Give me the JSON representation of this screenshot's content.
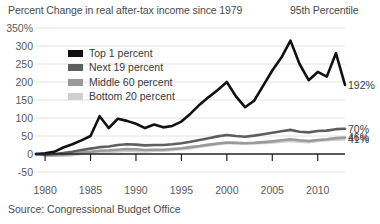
{
  "header": {
    "title": "Percent Change in real after-tax income since 1979",
    "right_note": "95th Percentile"
  },
  "source": "Source: Congressional Budget Office",
  "colors": {
    "top1": "#111111",
    "next19": "#5e5e5e",
    "middle60": "#9a9a9a",
    "bottom20": "#cfcfcf",
    "axis": "#222222",
    "grid": "#e2e2e2",
    "text": "#3a3a3a"
  },
  "legend": {
    "items": [
      {
        "label": "Top 1 percent",
        "color": "#111111"
      },
      {
        "label": "Next 19 percent",
        "color": "#5e5e5e"
      },
      {
        "label": "Middle 60 percent",
        "color": "#9a9a9a"
      },
      {
        "label": "Bottom 20 percent",
        "color": "#cfcfcf"
      }
    ]
  },
  "end_labels": [
    {
      "name": "top1",
      "text": "192%",
      "value": 192
    },
    {
      "name": "next19",
      "text": "70%",
      "value": 70
    },
    {
      "name": "middle60",
      "text": "46%",
      "value": 46
    },
    {
      "name": "bottom20",
      "text": "41%",
      "value": 41
    }
  ],
  "chart_data": {
    "type": "line",
    "title": "Percent Change in real after-tax income since 1979",
    "xlabel": "",
    "ylabel": "",
    "xlim": [
      1979,
      2013
    ],
    "ylim": [
      -50,
      350
    ],
    "ytick_labels": [
      "350%",
      "300",
      "250",
      "200",
      "150",
      "100",
      "50",
      "0",
      "-50"
    ],
    "yticks": [
      350,
      300,
      250,
      200,
      150,
      100,
      50,
      0,
      -50
    ],
    "xticks": [
      1980,
      1985,
      1990,
      1995,
      2000,
      2005,
      2010
    ],
    "xtick_labels": [
      "1980",
      "1985",
      "1990",
      "1995",
      "2000",
      "2005",
      "2010"
    ],
    "grid": true,
    "legend_position": "upper-left-inside",
    "x": [
      1979,
      1980,
      1981,
      1982,
      1983,
      1984,
      1985,
      1986,
      1987,
      1988,
      1989,
      1990,
      1991,
      1992,
      1993,
      1994,
      1995,
      1996,
      1997,
      1998,
      1999,
      2000,
      2001,
      2002,
      2003,
      2004,
      2005,
      2006,
      2007,
      2008,
      2009,
      2010,
      2011,
      2012,
      2013
    ],
    "series": [
      {
        "name": "Top 1 percent",
        "color": "#111111",
        "end_label": "192%",
        "values": [
          0,
          2,
          6,
          18,
          27,
          38,
          50,
          105,
          72,
          98,
          92,
          84,
          72,
          82,
          74,
          78,
          90,
          112,
          137,
          158,
          178,
          200,
          160,
          130,
          148,
          190,
          232,
          268,
          315,
          250,
          205,
          228,
          215,
          280,
          192
        ]
      },
      {
        "name": "Next 19 percent",
        "color": "#5e5e5e",
        "end_label": "70%",
        "values": [
          0,
          -2,
          0,
          3,
          6,
          11,
          15,
          19,
          21,
          25,
          27,
          26,
          24,
          25,
          25,
          27,
          30,
          34,
          39,
          44,
          49,
          53,
          50,
          48,
          51,
          55,
          59,
          63,
          67,
          62,
          60,
          64,
          65,
          69,
          70
        ]
      },
      {
        "name": "Middle 60 percent",
        "color": "#9a9a9a",
        "end_label": "46%",
        "values": [
          0,
          -3,
          -3,
          -2,
          0,
          4,
          6,
          9,
          10,
          12,
          14,
          13,
          11,
          12,
          12,
          14,
          16,
          19,
          22,
          26,
          29,
          32,
          31,
          30,
          31,
          33,
          35,
          38,
          41,
          38,
          36,
          39,
          41,
          44,
          46
        ]
      },
      {
        "name": "Bottom 20 percent",
        "color": "#cfcfcf",
        "end_label": "41%",
        "values": [
          0,
          -4,
          -5,
          -5,
          -3,
          0,
          2,
          4,
          5,
          7,
          9,
          8,
          7,
          9,
          9,
          11,
          13,
          16,
          20,
          24,
          27,
          30,
          30,
          29,
          30,
          31,
          32,
          34,
          36,
          34,
          33,
          36,
          38,
          40,
          41
        ]
      }
    ]
  }
}
